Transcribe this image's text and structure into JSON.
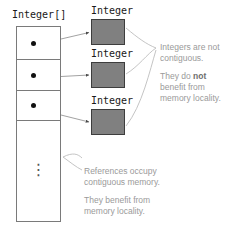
{
  "diagram": {
    "colors": {
      "object_fill": "#808080",
      "object_stroke": "#3d3d3d",
      "array_stroke": "#7a7a7a",
      "dot": "#111111",
      "note_text": "#9a9a9a",
      "leader_line": "#b0b0b0",
      "arrow_line": "#808080",
      "background": "#ffffff"
    }
  },
  "array": {
    "label": "Integer[]",
    "cells": [
      {
        "name": "array-cell-0",
        "content": "reference-dot"
      },
      {
        "name": "array-cell-1",
        "content": "reference-dot"
      },
      {
        "name": "array-cell-2",
        "content": "reference-dot"
      },
      {
        "name": "array-cell-remainder",
        "content": "⋮"
      }
    ],
    "ellipsis": "⋮"
  },
  "objects": [
    {
      "label": "Integer"
    },
    {
      "label": "Integer"
    },
    {
      "label": "Integer"
    }
  ],
  "notes": {
    "objects_note": {
      "name": "integers-note",
      "line1": "Integers are not",
      "line2": "contiguous.",
      "line3_pre": "They do ",
      "line3_em": "not",
      "line4": "benefit from",
      "line5": "memory locality."
    },
    "array_note": {
      "name": "references-note",
      "line1": "References occupy",
      "line2": "contiguous memory.",
      "line3": "They benefit from",
      "line4": "memory locality."
    }
  }
}
